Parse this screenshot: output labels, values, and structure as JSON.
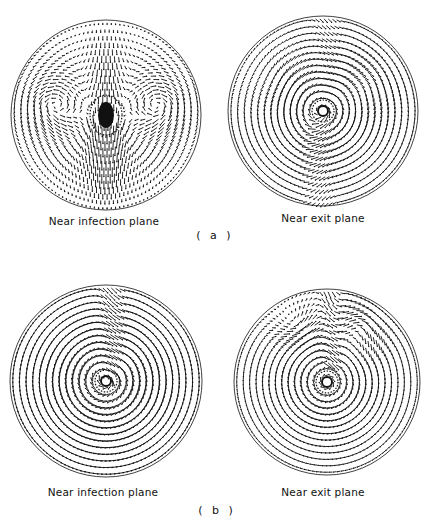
{
  "figure": {
    "rows": [
      {
        "caption": "( a )",
        "caption_pos": {
          "x": 215,
          "y": 229
        },
        "plots": [
          {
            "id": "a-left",
            "label": "Near infection plane",
            "cx": 106,
            "cy": 115,
            "r": 95,
            "label_pos": {
              "x": 104,
              "y": 215
            },
            "pattern": "four-vortex",
            "core_filled": true
          },
          {
            "id": "a-right",
            "label": "Near exit plane",
            "cx": 323,
            "cy": 111,
            "r": 95,
            "label_pos": {
              "x": 323,
              "y": 212
            },
            "pattern": "single-vortex",
            "core_filled": false
          }
        ]
      },
      {
        "caption": "( b )",
        "caption_pos": {
          "x": 217,
          "y": 504
        },
        "plots": [
          {
            "id": "b-left",
            "label": "Near infection plane",
            "cx": 106,
            "cy": 381,
            "r": 96,
            "label_pos": {
              "x": 103,
              "y": 486
            },
            "pattern": "swirl-dense",
            "core_filled": false
          },
          {
            "id": "b-right",
            "label": "Near exit plane",
            "cx": 327,
            "cy": 382,
            "r": 93,
            "label_pos": {
              "x": 323,
              "y": 486
            },
            "pattern": "swirl-top-vortices",
            "core_filled": false
          }
        ]
      }
    ],
    "colors": {
      "ink": "#111111",
      "background": "#ffffff"
    }
  }
}
